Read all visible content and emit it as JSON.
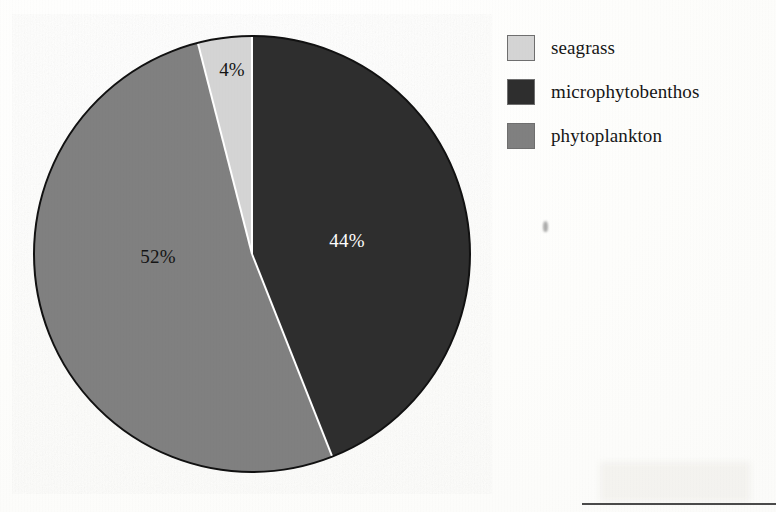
{
  "chart_data": {
    "type": "pie",
    "title": "",
    "subtitle": "",
    "xlabel": "",
    "ylabel": "",
    "legend_position": "right",
    "grid": false,
    "units": "percent",
    "categories": [
      "seagrass",
      "microphytobenthos",
      "phytoplankton"
    ],
    "values": [
      4,
      52,
      44
    ],
    "slices": [
      {
        "name": "microphytobenthos",
        "value": 44,
        "data_label": "44%",
        "color": "#2e2e2e",
        "label_color": "#ffffff",
        "start_angle_deg": 0,
        "end_angle_deg": 158.4,
        "label_x": 347,
        "label_y": 247
      },
      {
        "name": "phytoplankton",
        "value": 52,
        "data_label": "52%",
        "color": "#808080",
        "label_color": "#141414",
        "start_angle_deg": 158.4,
        "end_angle_deg": 345.6,
        "label_x": 158,
        "label_y": 263
      },
      {
        "name": "seagrass",
        "value": 4,
        "data_label": "4%",
        "color": "#d4d4d4",
        "label_color": "#141414",
        "start_angle_deg": 345.6,
        "end_angle_deg": 360,
        "label_x": 232,
        "label_y": 76
      }
    ],
    "geometry": {
      "center_x": 252,
      "center_y": 254,
      "radius": 218,
      "outline_color": "#111111",
      "outline_width": 2,
      "separator_color": "#ffffff",
      "separator_width": 2
    }
  },
  "legend": {
    "items": [
      {
        "label": "seagrass",
        "color": "#d4d4d4",
        "border": "#6f6f6f"
      },
      {
        "label": "microphytobenthos",
        "color": "#2e2e2e",
        "border": "#6f6f6f"
      },
      {
        "label": "phytoplankton",
        "color": "#808080",
        "border": "#6f6f6f"
      }
    ]
  },
  "artifacts": {
    "speck_label": "scan-speck",
    "rule_label": "cropped-table-top-border"
  }
}
